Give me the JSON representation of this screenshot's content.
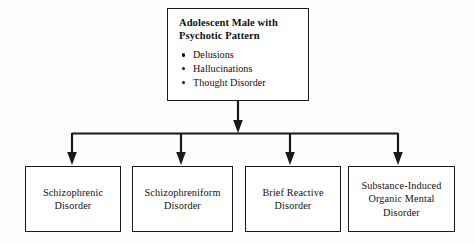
{
  "diagram": {
    "type": "hierarchy-flowchart",
    "orientation": "top-down",
    "background_color": "#fdfdfb",
    "line_color": "#1a1a1a",
    "box_fill_color": "#ffffff",
    "root": {
      "title": "Adolescent Male with\nPsychotic Pattern",
      "symptoms": [
        "Delusions",
        "Hallucinations",
        "Thought Disorder"
      ]
    },
    "leaves": [
      {
        "label": "Schizophrenic\nDisorder"
      },
      {
        "label": "Schizophreniform\nDisorder"
      },
      {
        "label": "Brief Reactive\nDisorder"
      },
      {
        "label": "Substance-Induced\nOrganic Mental\nDisorder"
      }
    ]
  }
}
